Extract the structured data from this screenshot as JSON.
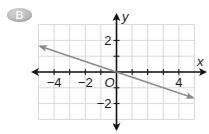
{
  "badge": {
    "label": "B",
    "color": "#b5b5b5"
  },
  "chart_data": {
    "type": "line",
    "title": "",
    "xlabel": "x",
    "ylabel": "y",
    "origin_label": "O",
    "xlim": [
      -5,
      5
    ],
    "ylim": [
      -3,
      3
    ],
    "grid": true,
    "x_tick_labels": [
      {
        "value": -4,
        "label": "−4"
      },
      {
        "value": -2,
        "label": "−2"
      },
      {
        "value": 4,
        "label": "4"
      }
    ],
    "y_tick_labels": [
      {
        "value": 2,
        "label": "2"
      },
      {
        "value": -2,
        "label": "−2"
      }
    ],
    "series": [
      {
        "name": "line",
        "equation": "y = -x/3",
        "slope": -0.3333,
        "intercept": 0,
        "x": [
          -4.9,
          0,
          4.9
        ],
        "y": [
          1.63,
          0,
          -1.63
        ],
        "arrows_both_ends": true,
        "color": "#8a8a8a"
      }
    ],
    "colors": {
      "axis": "#111111",
      "grid": "#d9d9d9",
      "line": "#8a8a8a"
    }
  }
}
